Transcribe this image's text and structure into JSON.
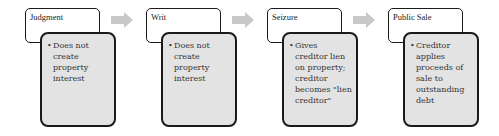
{
  "diagram": {
    "type": "process-flow",
    "steps": [
      {
        "title": "Judgment",
        "detail": "Does not create property interest"
      },
      {
        "title": "Writ",
        "detail": "Does not create property interest"
      },
      {
        "title": "Seizure",
        "detail": "Gives creditor lien on property; creditor becomes \"lien creditor\""
      },
      {
        "title": "Public Sale",
        "detail": "Creditor applies proceeds of sale to outstanding debt"
      }
    ],
    "bullet_glyph": "•",
    "colors": {
      "detail_fill": "#e3e3e3",
      "border": "#1a1a1a",
      "arrow": "#c8c8c8"
    }
  }
}
